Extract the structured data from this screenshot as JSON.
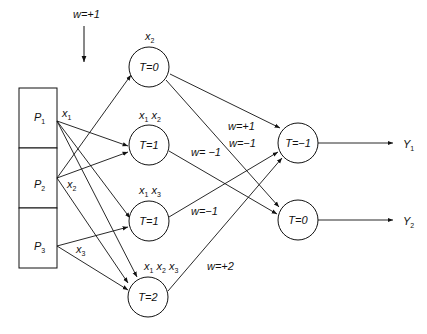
{
  "diagram": {
    "type": "threshold-logic neural network",
    "top_weight_label": "w=+1",
    "inputs": [
      {
        "id": "P1",
        "name": "P",
        "sub": "1",
        "output_label": "x",
        "output_sub": "1"
      },
      {
        "id": "P2",
        "name": "P",
        "sub": "2",
        "output_label": "x",
        "output_sub": "2"
      },
      {
        "id": "P3",
        "name": "P",
        "sub": "3",
        "output_label": "x",
        "output_sub": "3"
      }
    ],
    "hidden": [
      {
        "id": "h1",
        "threshold": "T=0",
        "inputs_label": [
          "x2"
        ]
      },
      {
        "id": "h2",
        "threshold": "T=1",
        "inputs_label": [
          "x1",
          "x2"
        ]
      },
      {
        "id": "h3",
        "threshold": "T=1",
        "inputs_label": [
          "x1",
          "x3"
        ]
      },
      {
        "id": "h4",
        "threshold": "T=2",
        "inputs_label": [
          "x1",
          "x2",
          "x3"
        ]
      }
    ],
    "outputs": [
      {
        "id": "o1",
        "threshold": "T=−1",
        "label": "Y",
        "sub": "1"
      },
      {
        "id": "o2",
        "threshold": "T=0",
        "label": "Y",
        "sub": "2"
      }
    ],
    "weights": {
      "h1_o1": "w=−1",
      "h1_o2": "w=+1",
      "h2_o2": "w= −1",
      "h3_o1": "w=−1",
      "h4_o1": "w=+2"
    }
  }
}
